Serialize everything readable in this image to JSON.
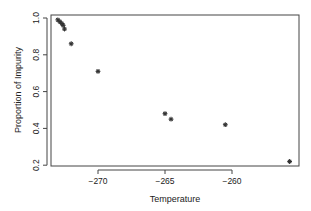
{
  "chart_data": {
    "type": "scatter",
    "title": "",
    "xlabel": "Temperature",
    "ylabel": "Proportion of Impurity",
    "x_ticks": [
      -270,
      -265,
      -260
    ],
    "x_tick_labels": [
      "−270",
      "−265",
      "−260"
    ],
    "y_ticks": [
      0.2,
      0.4,
      0.6,
      0.8,
      1.0
    ],
    "y_tick_labels": [
      "0.2",
      "0.4",
      "0.6",
      "0.8",
      "1.0"
    ],
    "xlim": [
      -273.5,
      -255.0
    ],
    "ylim": [
      0.19,
      1.01
    ],
    "grid": false,
    "legend": null,
    "marker": "asterisk",
    "points": [
      {
        "x": -273.0,
        "y": 0.99
      },
      {
        "x": -272.85,
        "y": 0.98
      },
      {
        "x": -272.7,
        "y": 0.97
      },
      {
        "x": -272.6,
        "y": 0.96
      },
      {
        "x": -272.5,
        "y": 0.94
      },
      {
        "x": -272.0,
        "y": 0.86
      },
      {
        "x": -270.0,
        "y": 0.71
      },
      {
        "x": -265.0,
        "y": 0.48
      },
      {
        "x": -264.55,
        "y": 0.45
      },
      {
        "x": -260.5,
        "y": 0.42
      },
      {
        "x": -255.7,
        "y": 0.22
      }
    ]
  },
  "colors": {
    "axis": "#444444",
    "marker": "#333333",
    "text": "#222222",
    "background": "#ffffff"
  }
}
